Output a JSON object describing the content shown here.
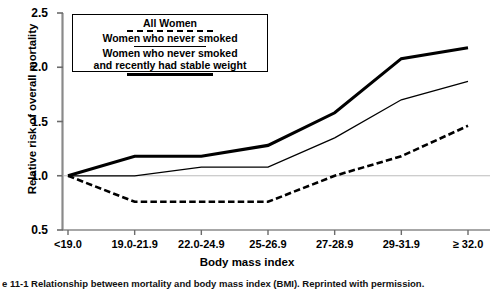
{
  "chart_data": {
    "type": "line",
    "title": "",
    "xlabel": "Body mass index",
    "ylabel": "Relative risk of overall mortality",
    "categories": [
      "<19.0",
      "19.0-21.9",
      "22.0-24.9",
      "25-26.9",
      "27-28.9",
      "29-31.9",
      "≥ 32.0"
    ],
    "yticks": [
      "2.5",
      "2.0",
      "1.5",
      "1.0",
      "0.5"
    ],
    "ylim": [
      0.5,
      2.5
    ],
    "grid": false,
    "reference_line": 1.0,
    "legend_position": "top-center-inside",
    "series": [
      {
        "name": "All Women",
        "style": "thick-solid",
        "values": [
          1.0,
          1.18,
          1.18,
          1.28,
          1.58,
          2.08,
          2.18
        ]
      },
      {
        "name": "Women who never smoked",
        "style": "thin-solid",
        "values": [
          1.0,
          1.0,
          1.08,
          1.08,
          1.35,
          1.7,
          1.87
        ]
      },
      {
        "name": "Women who never smoked and recently had stable weight",
        "style": "dashed",
        "values": [
          1.0,
          0.76,
          0.76,
          0.76,
          1.0,
          1.18,
          1.46
        ]
      }
    ]
  },
  "legend": {
    "entries": [
      {
        "label": "All Women",
        "sample": "thick-solid"
      },
      {
        "label": "Women who never smoked",
        "sample": "dashed"
      },
      {
        "label_line1": "Women who never smoked",
        "label_line2": "and recently had stable weight",
        "sample": "thin-solid"
      }
    ]
  },
  "axes": {
    "ylabel": "Relative risk of overall mortality",
    "xlabel": "Body mass index"
  },
  "caption": {
    "text": "e 11-1  Relationship between mortality and body mass index (BMI).  Reprinted with permission."
  },
  "colors": {
    "line": "#000000",
    "reference": "#b4b4b4",
    "background": "#ffffff"
  }
}
